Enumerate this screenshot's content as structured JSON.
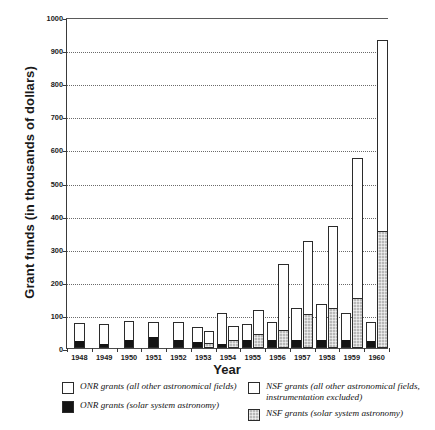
{
  "chart_data": {
    "type": "bar",
    "title": "",
    "xlabel": "Year",
    "ylabel": "Grant funds (in thousands of dollars)",
    "ylim": [
      0,
      1000
    ],
    "yticks": [
      0,
      100,
      200,
      300,
      400,
      500,
      600,
      700,
      800,
      900,
      1000
    ],
    "ytick_labels": [
      "0",
      "100",
      "200",
      "300",
      "400",
      "500",
      "600",
      "700",
      "800",
      "900",
      "1000"
    ],
    "grid": true,
    "grid_style": "dotted horizontal",
    "legend_position": "below-axes",
    "categories": [
      "1948",
      "1949",
      "1950",
      "1951",
      "1952",
      "1953",
      "1954",
      "1955",
      "1956",
      "1957",
      "1958",
      "1959",
      "1960"
    ],
    "groups": [
      {
        "name": "ONR",
        "bar_side": "left",
        "series": [
          {
            "name": "ONR grants (solar system astronomy)",
            "fill": "black",
            "color": "#141414",
            "values": [
              18,
              8,
              22,
              30,
              22,
              14,
              10,
              22,
              22,
              20,
              22,
              22,
              18
            ]
          },
          {
            "name": "ONR grants (all other astronomical fields)",
            "fill": "white",
            "color": "#ffffff",
            "values": [
              58,
              64,
              60,
              48,
              56,
              48,
              95,
              50,
              58,
              100,
              110,
              85,
              60
            ]
          }
        ],
        "totals": [
          76,
          72,
          82,
          78,
          78,
          62,
          105,
          72,
          80,
          120,
          132,
          107,
          78
        ]
      },
      {
        "name": "NSF",
        "bar_side": "right",
        "series": [
          {
            "name": "NSF grants (solar system astronomy)",
            "fill": "gray-stipple",
            "color": "#b9b9b9",
            "values": [
              0,
              0,
              0,
              0,
              0,
              12,
              20,
              40,
              50,
              100,
              118,
              148,
              350
            ]
          },
          {
            "name": "NSF grants (all other astronomical fields, instrumentation excluded)",
            "fill": "white",
            "color": "#ffffff",
            "values": [
              0,
              0,
              0,
              0,
              0,
              38,
              48,
              75,
              205,
              222,
              252,
              427,
              580
            ]
          }
        ],
        "totals": [
          0,
          0,
          0,
          0,
          0,
          50,
          68,
          115,
          255,
          322,
          370,
          575,
          930
        ]
      }
    ],
    "annotations": []
  },
  "legend": {
    "left_column": [
      {
        "label": "ONR grants (all other astronomical fields)",
        "swatch": "white-outline"
      },
      {
        "label": "ONR grants (solar system astronomy)",
        "swatch": "black-fill"
      }
    ],
    "right_column": [
      {
        "label": "NSF grants (all other astronomical fields, instrumentation excluded)",
        "swatch": "white-outline"
      },
      {
        "label": "NSF grants (solar system astronomy)",
        "swatch": "gray-stipple"
      }
    ]
  },
  "colors": {
    "axis": "#3a3a3a",
    "grid": "#6a6a6a",
    "onr_solar": "#141414",
    "onr_other": "#ffffff",
    "nsf_solar": "#b9b9b9",
    "nsf_other": "#ffffff",
    "text": "#1a1a1a"
  }
}
